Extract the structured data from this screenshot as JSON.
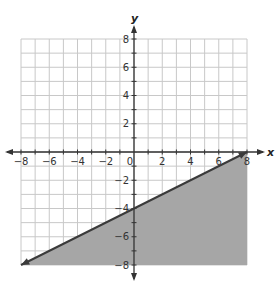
{
  "chart_data": {
    "type": "line",
    "subtype": "linear-inequality-graph",
    "title": "",
    "xlabel": "x",
    "ylabel": "y",
    "xlim": [
      -8,
      8
    ],
    "ylim": [
      -8,
      8
    ],
    "grid": true,
    "grid_step": 1,
    "x_tick_labels": [
      "-8",
      "-6",
      "-4",
      "-2",
      "0",
      "2",
      "4",
      "6",
      "8"
    ],
    "y_tick_labels": [
      "8",
      "6",
      "4",
      "2",
      "-2",
      "-4",
      "-6",
      "-8"
    ],
    "line": {
      "points": [
        [
          -8,
          -8
        ],
        [
          8,
          0
        ]
      ],
      "slope": 0.5,
      "y_intercept": -4,
      "equation": "y = 0.5x - 4",
      "style": "solid",
      "arrows": "both"
    },
    "shaded_region": "below line",
    "inequality": "y ≤ 0.5x - 4",
    "colors": {
      "grid": "#c8c8c8",
      "axis": "#333333",
      "line": "#3a3a3a",
      "shade": "#a6a6a6"
    }
  },
  "labels": {
    "x_axis": "x",
    "y_axis": "y",
    "origin": "0"
  }
}
